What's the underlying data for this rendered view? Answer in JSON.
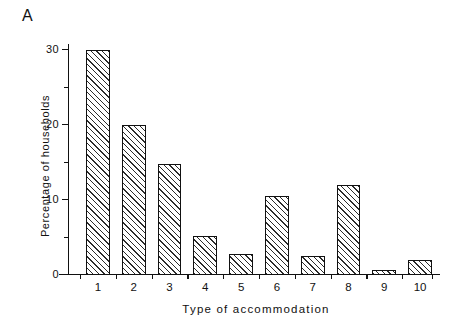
{
  "figure": {
    "panel_label": "A"
  },
  "chart_data": {
    "type": "bar",
    "title": "",
    "panel": "A",
    "xlabel": "Type of accommodation",
    "ylabel": "Percentage of households",
    "categories": [
      "1",
      "2",
      "3",
      "4",
      "5",
      "6",
      "7",
      "8",
      "9",
      "10"
    ],
    "values": [
      30,
      20,
      14.8,
      5.2,
      2.8,
      10.5,
      2.5,
      12,
      0.7,
      2
    ],
    "ylim": [
      0,
      31
    ],
    "xlim": [
      0.5,
      10.5
    ],
    "ytick_labels": [
      "0",
      "10",
      "20",
      "30"
    ],
    "ytick_values": [
      0,
      10,
      20,
      30
    ],
    "yticks_minor": [
      5,
      15,
      25
    ],
    "xtick_labels": [
      "1",
      "2",
      "3",
      "4",
      "5",
      "6",
      "7",
      "8",
      "9",
      "10"
    ],
    "grid": false,
    "legend": null,
    "bar_fill": "hatched-diagonal",
    "bar_edge_color": "#111111",
    "bar_face_color": "#ffffff"
  }
}
